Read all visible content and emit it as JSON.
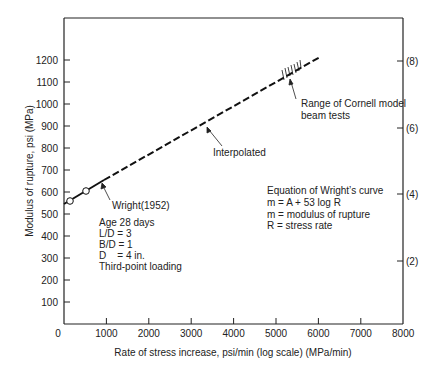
{
  "chart_data": {
    "type": "line",
    "title": "",
    "xlabel": "Rate of stress increase, psi/min (log scale) (MPa/min)",
    "ylabel": "Modulus of rupture, psi (MPa)",
    "xlim": [
      0,
      8000
    ],
    "ylim": [
      0,
      1300
    ],
    "x_ticks": [
      "0",
      "1000",
      "2000",
      "3000",
      "4000",
      "5000",
      "6000",
      "7000",
      "8000"
    ],
    "y_ticks": [
      "100",
      "200",
      "300",
      "400",
      "500",
      "600",
      "700",
      "800",
      "900",
      "1000",
      "1100",
      "1200"
    ],
    "y2_ticks": [
      "(2)",
      "(4)",
      "(6)",
      "(8)"
    ],
    "grid": false,
    "series": [
      {
        "name": "Wright(1952)",
        "style": "solid",
        "x": [
          0,
          1000
        ],
        "y": [
          555,
          655
        ]
      },
      {
        "name": "Interpolated",
        "style": "dashed",
        "x": [
          1000,
          6000
        ],
        "y": [
          655,
          1215
        ]
      }
    ],
    "points": [
      {
        "x": 150,
        "y": 570,
        "marker": "open-circle"
      },
      {
        "x": 520,
        "y": 615,
        "marker": "open-circle"
      }
    ],
    "annotations": [
      "Wright(1952)",
      "Interpolated",
      "Range of Cornell model beam tests",
      "Equation of Wright's curve",
      "m = A + 53 log R",
      "m = modulus of rupture",
      "R = stress rate",
      "Age 28 days",
      "L/D = 3",
      "B/D = 1",
      "D    = 4 in.",
      "Third-point loading"
    ]
  },
  "labels": {
    "xlabel": "Rate of stress increase, psi/min (log scale) (MPa/min)",
    "ylabel": "Modulus of rupture, psi (MPa)",
    "wright": "Wright(1952)",
    "interp": "Interpolated",
    "cornell1": "Range of Cornell model",
    "cornell2": "beam tests",
    "eq1": "Equation of Wright’s curve",
    "eq2": "m = A + 53 log R",
    "eq3": "m = modulus of rupture",
    "eq4": "R = stress rate",
    "cond1": "Age 28 days",
    "cond2": "L/D = 3",
    "cond3": "B/D = 1",
    "cond4": "D    = 4 in.",
    "cond5": "Third-point loading"
  }
}
